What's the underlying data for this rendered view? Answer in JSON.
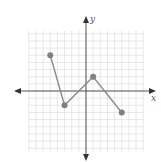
{
  "chart_data": {
    "type": "line",
    "title": "",
    "xlabel": "x",
    "ylabel": "y",
    "xlim": [
      -8,
      8
    ],
    "ylim": [
      -8,
      8
    ],
    "grid": true,
    "grid_step": 1,
    "legend": null,
    "series": [
      {
        "name": "piecewise-linear",
        "points": [
          {
            "x": -5,
            "y": 5
          },
          {
            "x": -3,
            "y": -2
          },
          {
            "x": 1,
            "y": 2
          },
          {
            "x": 5,
            "y": -3
          }
        ],
        "closed_endpoints": true
      }
    ]
  },
  "colors": {
    "grid": "#d9d9d9",
    "axis": "#555555",
    "line": "#8c8c8c",
    "point": "#808080"
  },
  "labels": {
    "x_axis": "x",
    "y_axis": "y"
  }
}
